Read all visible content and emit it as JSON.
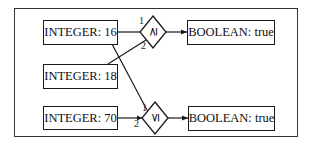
{
  "diagram": {
    "inputs": [
      {
        "id": "int16",
        "label": "INTEGER: 16"
      },
      {
        "id": "int18",
        "label": "INTEGER: 18"
      },
      {
        "id": "int70",
        "label": "INTEGER: 70"
      }
    ],
    "operators": [
      {
        "id": "ge",
        "symbol": "≥",
        "port1": "1",
        "port2": "2"
      },
      {
        "id": "le",
        "symbol": "≤",
        "port1": "1",
        "port2": "2"
      }
    ],
    "outputs": [
      {
        "id": "out_ge",
        "label": "BOOLEAN: true"
      },
      {
        "id": "out_le",
        "label": "BOOLEAN: true"
      }
    ],
    "edges": [
      {
        "from": "INTEGER: 16",
        "to": "≥",
        "port": "1"
      },
      {
        "from": "INTEGER: 18",
        "to": "≥",
        "port": "2"
      },
      {
        "from": "INTEGER: 16",
        "to": "≤",
        "port": "1"
      },
      {
        "from": "INTEGER: 70",
        "to": "≤",
        "port": "2"
      },
      {
        "from": "≥",
        "to": "BOOLEAN: true"
      },
      {
        "from": "≤",
        "to": "BOOLEAN: true"
      }
    ]
  }
}
